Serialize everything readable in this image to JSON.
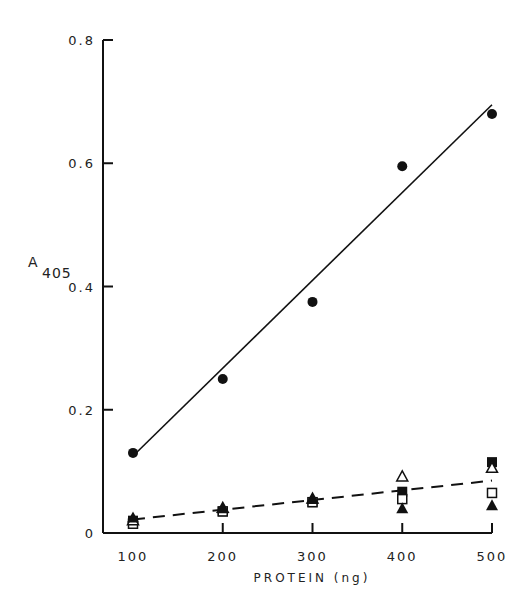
{
  "chart_data": {
    "type": "scatter",
    "title": "",
    "xlabel": "PROTEIN (ng)",
    "ylabel": "A",
    "ylabel_subscript": "405",
    "xlim": [
      100,
      500
    ],
    "ylim": [
      0,
      0.8
    ],
    "x_ticks": [
      100,
      200,
      300,
      400,
      500
    ],
    "x_tick_labels": [
      "100",
      "200",
      "300",
      "400",
      "500"
    ],
    "y_ticks": [
      0,
      0.2,
      0.4,
      0.6,
      0.8
    ],
    "y_tick_labels": [
      "0",
      "0.2",
      "0.4",
      "0.6",
      "0.8"
    ],
    "grid": false,
    "legend": null,
    "x": [
      100,
      200,
      300,
      400,
      500
    ],
    "series": [
      {
        "name": "filled circles",
        "marker": "filled-circle",
        "values": [
          0.13,
          0.25,
          0.375,
          0.595,
          0.68
        ]
      },
      {
        "name": "filled squares",
        "marker": "filled-square",
        "values": [
          0.02,
          0.035,
          0.05,
          0.067,
          0.115
        ]
      },
      {
        "name": "open squares",
        "marker": "open-square",
        "values": [
          0.015,
          0.035,
          0.05,
          0.055,
          0.065
        ]
      },
      {
        "name": "open triangles",
        "marker": "open-triangle",
        "values": [
          0.02,
          0.04,
          0.055,
          0.091,
          0.105
        ]
      },
      {
        "name": "filled triangles",
        "marker": "filled-triangle",
        "values": [
          0.025,
          0.04,
          0.055,
          0.04,
          0.045
        ]
      }
    ],
    "fit_lines": [
      {
        "name": "solid fit (filled circles)",
        "style": "solid",
        "x": [
          100,
          500
        ],
        "y": [
          0.125,
          0.695
        ]
      },
      {
        "name": "dashed fit (other series)",
        "style": "dashed",
        "x": [
          100,
          500
        ],
        "y": [
          0.022,
          0.085
        ]
      }
    ]
  }
}
